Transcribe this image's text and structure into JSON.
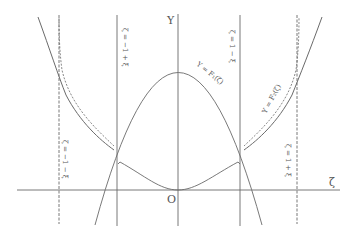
{
  "diagram": {
    "axes": {
      "y_label": "Y",
      "x_label": "ζ",
      "origin_label": "O"
    },
    "vertical_lines": [
      {
        "id": "line-neg-1-minus-xi",
        "label": "ζ = −1 − ξ",
        "x": 59,
        "style": "dashed"
      },
      {
        "id": "line-neg-1-plus-xi",
        "label": "ζ = −1 + ξ",
        "x": 117,
        "style": "solid"
      },
      {
        "id": "line-1-minus-xi",
        "label": "ζ = 1 − ξ",
        "x": 240,
        "style": "solid"
      },
      {
        "id": "line-1-plus-xi",
        "label": "ζ = 1 + ξ",
        "x": 297,
        "style": "dashed"
      }
    ],
    "curves": [
      {
        "id": "curve-f1",
        "label": "Y = F₁(ζ)"
      },
      {
        "id": "curve-f2",
        "label": "Y = F₂(ζ)"
      }
    ],
    "colors": {
      "line": "#6a6a6a",
      "text": "#555555",
      "background": "#ffffff"
    }
  }
}
